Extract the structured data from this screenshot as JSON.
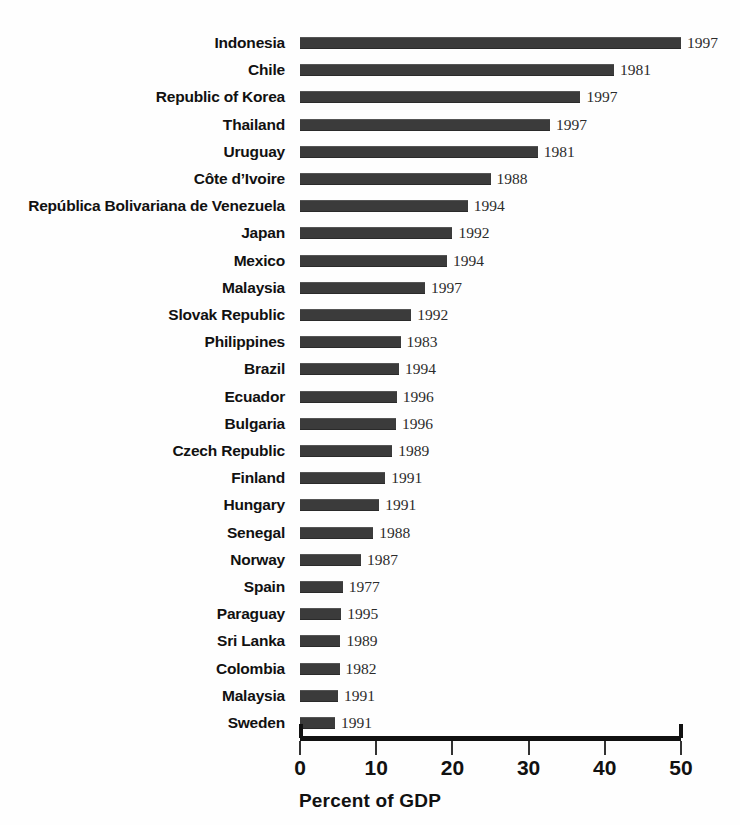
{
  "chart_data": {
    "type": "bar",
    "orientation": "horizontal",
    "title": "",
    "subtitle": "",
    "xlabel": "Percent of GDP",
    "ylabel": "",
    "xlim": [
      0,
      50
    ],
    "xticks": [
      0,
      10,
      20,
      30,
      40,
      50
    ],
    "xtick_labels": [
      "0",
      "10",
      "20",
      "30",
      "40",
      "50"
    ],
    "grid": false,
    "legend": null,
    "bar_color": "#3b3b3b",
    "background_color": "#fefefe",
    "categories": [
      "Indonesia",
      "Chile",
      "Republic of Korea",
      "Thailand",
      "Uruguay",
      "Côte d’Ivoire",
      "República Bolivariana de Venezuela",
      "Japan",
      "Mexico",
      "Malaysia",
      "Slovak Republic",
      "Philippines",
      "Brazil",
      "Ecuador",
      "Bulgaria",
      "Czech Republic",
      "Finland",
      "Hungary",
      "Senegal",
      "Norway",
      "Spain",
      "Paraguay",
      "Sri Lanka",
      "Colombia",
      "Malaysia",
      "Sweden"
    ],
    "values": [
      50.0,
      41.2,
      36.8,
      32.8,
      31.2,
      25.0,
      22.0,
      20.0,
      19.3,
      16.4,
      14.6,
      13.2,
      13.0,
      12.7,
      12.6,
      12.1,
      11.2,
      10.4,
      9.6,
      8.0,
      5.6,
      5.4,
      5.3,
      5.2,
      5.0,
      4.6
    ],
    "annotations": [
      "1997",
      "1981",
      "1997",
      "1997",
      "1981",
      "1988",
      "1994",
      "1992",
      "1994",
      "1997",
      "1992",
      "1983",
      "1994",
      "1996",
      "1996",
      "1989",
      "1991",
      "1991",
      "1988",
      "1987",
      "1977",
      "1995",
      "1989",
      "1982",
      "1991",
      "1991"
    ],
    "annotation_label": "year of crisis"
  }
}
